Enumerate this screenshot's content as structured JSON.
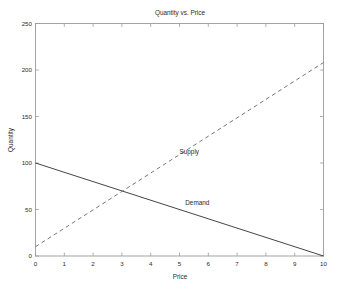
{
  "chart_data": {
    "type": "line",
    "title": "Quantity vs. Price",
    "xlabel": "Price",
    "ylabel": "Quantity",
    "xlim": [
      0,
      10
    ],
    "ylim": [
      0,
      250
    ],
    "xticks": [
      0,
      1,
      2,
      3,
      4,
      5,
      6,
      7,
      8,
      9,
      10
    ],
    "xticklabels": [
      "0",
      "1",
      "2",
      "3",
      "4",
      "5",
      "6",
      "7",
      "8",
      "9",
      "10"
    ],
    "yticks": [
      0,
      50,
      100,
      150,
      200,
      250
    ],
    "yticklabels": [
      "0",
      "50",
      "100",
      "150",
      "200",
      "250"
    ],
    "grid": false,
    "legend": "none",
    "background_color": "#ffffff",
    "axis_color": "#9a9a9a",
    "series": [
      {
        "name": "Demand",
        "style": "solid",
        "color": "#3a3a3a",
        "x": [
          0,
          10
        ],
        "values": [
          100,
          0
        ],
        "label_at": {
          "x": 5.2,
          "y": 57
        }
      },
      {
        "name": "Supply",
        "style": "dashed",
        "color": "#6f6f6f",
        "x": [
          0,
          10
        ],
        "values": [
          10,
          208
        ],
        "label_at": {
          "x": 5.0,
          "y": 112
        }
      }
    ],
    "annotations": [
      {
        "text": "Supply",
        "x": 5.0,
        "y": 112
      },
      {
        "text": "Demand",
        "x": 5.2,
        "y": 57
      }
    ],
    "equilibrium": {
      "x": 3.0,
      "y": 70
    }
  }
}
